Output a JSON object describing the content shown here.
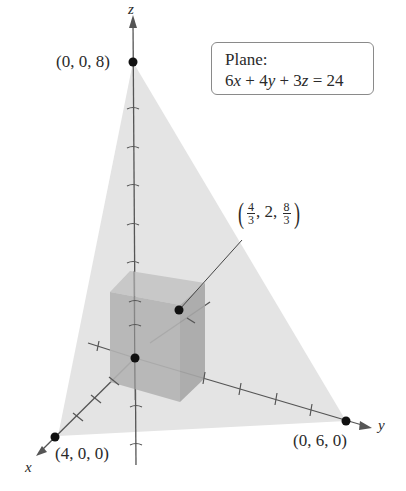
{
  "figure": {
    "axes": {
      "x_label": "x",
      "y_label": "y",
      "z_label": "z"
    },
    "intercepts": {
      "z": "(0, 0, 8)",
      "x": "(4, 0, 0)",
      "y": "(0, 6, 0)"
    },
    "plane_box": {
      "title": "Plane:",
      "equation_parts": [
        "6",
        "x",
        " + 4",
        "y",
        " + 3",
        "z",
        " = 24"
      ]
    },
    "box_point": {
      "x_num": "4",
      "x_den": "3",
      "y": "2",
      "z_num": "8",
      "z_den": "3"
    },
    "colors": {
      "plane_fill": "#e4e4e4",
      "box_front": "#b4b4b4",
      "box_top": "#c7c7c7",
      "box_side": "#a8a8a8",
      "axis": "#555555",
      "point": "#111111"
    }
  }
}
